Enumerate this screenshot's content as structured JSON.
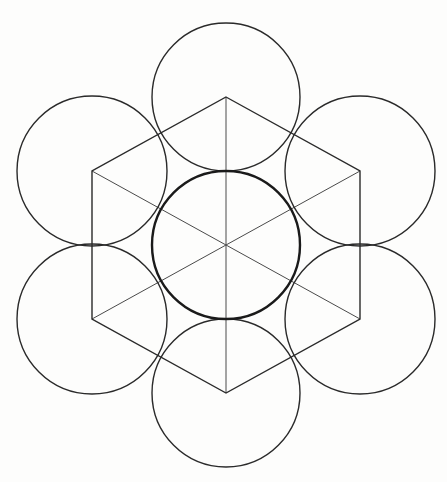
{
  "diagram": {
    "type": "sacred-geometry-seed-hexagon",
    "background": "#fdfdfc",
    "stroke_color": "#2a2a2a",
    "center": {
      "x": 226,
      "y": 245
    },
    "radius": 74,
    "center_circle": {
      "cx": 226,
      "cy": 245,
      "r": 74
    },
    "outer_circles": [
      {
        "name": "top",
        "cx": 226,
        "cy": 97,
        "r": 74
      },
      {
        "name": "upper-right",
        "cx": 360,
        "cy": 171,
        "r": 75
      },
      {
        "name": "lower-right",
        "cx": 360,
        "cy": 319,
        "r": 75
      },
      {
        "name": "bottom",
        "cx": 226,
        "cy": 393,
        "r": 74
      },
      {
        "name": "lower-left",
        "cx": 92,
        "cy": 319,
        "r": 75
      },
      {
        "name": "upper-left",
        "cx": 92,
        "cy": 171,
        "r": 75
      }
    ],
    "hexagon_points": "226,97 360,171 360,319 226,393 92,319 92,171",
    "spokes": [
      {
        "name": "vertical",
        "x1": 226,
        "y1": 97,
        "x2": 226,
        "y2": 393
      },
      {
        "name": "diag-1",
        "x1": 92,
        "y1": 171,
        "x2": 360,
        "y2": 319
      },
      {
        "name": "diag-2",
        "x1": 360,
        "y1": 171,
        "x2": 92,
        "y2": 319
      }
    ]
  }
}
